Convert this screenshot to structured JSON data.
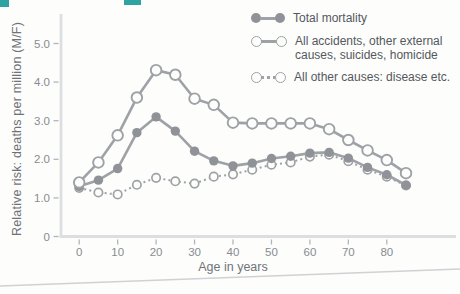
{
  "accent_color": "#2fa3a1",
  "colors": {
    "line_gray": "#9ea2a6",
    "filled_marker": "#8f9397",
    "axis_gray": "#dcdedf",
    "tick_gray": "#b3b6b9",
    "tick_label": "#888c90",
    "axis_title": "#70747a",
    "legend_text": "#54585d",
    "page_curl": "#cfd2d3",
    "background": "#fdfdfc"
  },
  "chart_data": {
    "type": "line",
    "title": "",
    "xlabel": "Age in years",
    "ylabel": "Relative risk: deaths per million (M/F)",
    "x_ticks": [
      0,
      10,
      20,
      30,
      40,
      50,
      60,
      70,
      80
    ],
    "y_tick_labels": [
      "0",
      "1.0",
      "2.0",
      "3.0",
      "4.0",
      "5.0"
    ],
    "y_tick_values": [
      0,
      1,
      2,
      3,
      4,
      5
    ],
    "xlim": [
      -5,
      93
    ],
    "ylim": [
      0,
      5.2
    ],
    "grid": false,
    "x": [
      0,
      5,
      10,
      15,
      20,
      25,
      30,
      35,
      40,
      45,
      50,
      55,
      60,
      65,
      70,
      75,
      80,
      85
    ],
    "series": [
      {
        "name": "Total mortality",
        "marker": "filled-circle",
        "line": "solid",
        "values": [
          1.3,
          1.46,
          1.76,
          2.69,
          3.1,
          2.73,
          2.21,
          1.96,
          1.83,
          1.9,
          2.02,
          2.08,
          2.16,
          2.18,
          2.03,
          1.79,
          1.6,
          1.33
        ]
      },
      {
        "name": "All accidents, other external causes, suicides, homicide",
        "marker": "open-circle",
        "line": "solid",
        "values": [
          1.4,
          1.92,
          2.62,
          3.6,
          4.31,
          4.19,
          3.57,
          3.41,
          2.95,
          2.93,
          2.93,
          2.93,
          2.93,
          2.78,
          2.5,
          2.23,
          1.98,
          1.64
        ]
      },
      {
        "name": "All other causes: disease etc.",
        "marker": "open-circle",
        "line": "dotted",
        "values": [
          1.26,
          1.14,
          1.09,
          1.34,
          1.52,
          1.43,
          1.37,
          1.55,
          1.61,
          1.73,
          1.86,
          1.92,
          2.07,
          2.12,
          1.95,
          1.73,
          1.55,
          1.32
        ]
      }
    ],
    "legend": {
      "position": "top-right",
      "items": [
        {
          "lines": [
            "Total mortality"
          ]
        },
        {
          "lines": [
            "All accidents, other external",
            "causes, suicides, homicide"
          ]
        },
        {
          "lines": [
            "All other causes: disease etc."
          ]
        }
      ]
    }
  }
}
